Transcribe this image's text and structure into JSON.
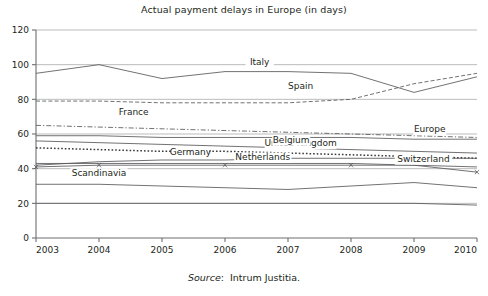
{
  "chart_data": {
    "type": "line",
    "title": "Actual payment delays in Europe (in days)",
    "xlabel": "",
    "ylabel": "",
    "x": [
      2003,
      2004,
      2005,
      2006,
      2007,
      2008,
      2009,
      2010
    ],
    "xtick_labels": [
      "2003",
      "2004",
      "2005",
      "2006",
      "2007",
      "2008",
      "2009",
      "2010"
    ],
    "ytick_labels": [
      "0",
      "20",
      "40",
      "60",
      "80",
      "100",
      "120"
    ],
    "yticks": [
      0,
      20,
      40,
      60,
      80,
      100,
      120
    ],
    "ylim": [
      0,
      120
    ],
    "xlim": [
      2003,
      2010
    ],
    "grid": true,
    "legend_position": "inline-labels",
    "series": [
      {
        "name": "Italy",
        "style": "solid",
        "values": [
          95,
          100,
          92,
          96,
          96,
          95,
          84,
          93
        ],
        "label_x": 2006.55,
        "label_y": 100
      },
      {
        "name": "Spain",
        "style": "dashed",
        "values": [
          79,
          79,
          78,
          78,
          78,
          80,
          89,
          95
        ],
        "label_x": 2007.2,
        "label_y": 86
      },
      {
        "name": "France",
        "style": "dashdot",
        "values": [
          65,
          64,
          63,
          62,
          61,
          60,
          59,
          58
        ],
        "label_x": 2004.55,
        "label_y": 71
      },
      {
        "name": "Europe",
        "style": "solid",
        "values": [
          59,
          59,
          58,
          58,
          58,
          58,
          57,
          57
        ],
        "label_x": 2009.25,
        "label_y": 61
      },
      {
        "name": "United Kingdom",
        "style": "solid",
        "values": [
          56,
          55,
          54,
          53,
          52,
          51,
          50,
          49
        ],
        "label_x": 2007.2,
        "label_y": 53
      },
      {
        "name": "Belgium",
        "style": "dotted",
        "values": [
          52,
          51,
          50,
          50,
          49,
          48,
          47,
          46
        ],
        "label_x": 2007.05,
        "label_y": 55
      },
      {
        "name": "Germany",
        "style": "solid",
        "values": [
          42,
          44,
          45,
          45,
          46,
          46,
          46,
          46
        ],
        "label_x": 2005.45,
        "label_y": 48
      },
      {
        "name": "Netherlands",
        "style": "solid",
        "values": [
          43,
          43,
          43,
          43,
          43,
          43,
          42,
          41
        ],
        "label_x": 2006.6,
        "label_y": 45
      },
      {
        "name": "Switzerland",
        "style": "solid-x",
        "values": [
          41,
          42,
          42,
          42,
          42,
          42,
          42,
          38
        ],
        "label_x": 2009.15,
        "label_y": 44
      },
      {
        "name": "Scandinavia",
        "style": "solid",
        "values": [
          31,
          31,
          30,
          29,
          28,
          30,
          32,
          29
        ],
        "label_x": 2004.0,
        "label_y": 36
      }
    ],
    "extra_line": {
      "name": "unlabeled-low-line",
      "style": "solid",
      "values": [
        20,
        20,
        20,
        20,
        20,
        20,
        20,
        19
      ]
    }
  },
  "source": {
    "prefix": "Source",
    "separator": ":",
    "text": "Intrum Justitia."
  },
  "colors": {
    "axis": "#6d6e71",
    "grid": "#9d9fa2",
    "line": "#58595b",
    "line_dark": "#3a3a3c",
    "text": "#231f20",
    "background": "#ffffff"
  }
}
